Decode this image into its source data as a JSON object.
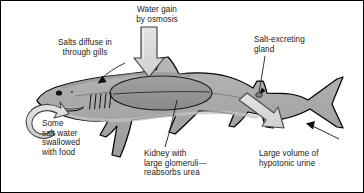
{
  "figure": {
    "organism": "shark",
    "border_color": "#000000",
    "background": "#ffffff"
  },
  "colors": {
    "body_fill": "#a8a8a8",
    "body_fill_light": "#bdbdbd",
    "body_fill_dark": "#9a9a9a",
    "kidney_fill": "#8f8f8f",
    "outline": "#000000",
    "arrow_fill": "#d8d8d8",
    "arrow_outline": "#4a4a4a",
    "text": "#1a1a1a"
  },
  "labels": {
    "water_gain": {
      "text": "Water gain\nby osmosis",
      "align": "center",
      "marker": "large-outlined-down-arrow"
    },
    "salts_gills": {
      "text": "Salts diffuse in\nthrough gills",
      "align": "center",
      "marker": "black-leader-arrow"
    },
    "salt_gland": {
      "text": "Salt-excreting\ngland",
      "align": "left",
      "marker": "black-leader-arrow"
    },
    "some_salt_water": {
      "text": "Some\nsalt water\nswallowed\nwith food",
      "align": "left",
      "marker": "curved-outlined-loop-arrow"
    },
    "kidney": {
      "text": "Kidney with\nlarge glomeruli—\nreabsorbs urea",
      "align": "left",
      "marker": "thin-leader-line"
    },
    "hypotonic_urine": {
      "text": "Large volume of\nhypotonic urine",
      "align": "left",
      "marker": "large-outlined-arrow-and-black-arrow"
    }
  },
  "anatomy": {
    "eye": "eye",
    "mouth": "mouth",
    "gill_slits": "gill-slits",
    "dorsal_fin": "first-dorsal-fin",
    "second_dorsal_fin": "second-dorsal-fin",
    "pectoral_fin": "pectoral-fin",
    "pelvic_fin": "pelvic-fin",
    "anal_fin": "anal-fin",
    "caudal_fin": "caudal-fin",
    "kidney": "kidney",
    "cloaca": "cloaca"
  }
}
